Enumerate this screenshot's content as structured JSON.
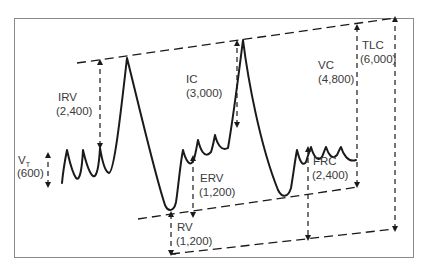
{
  "diagram": {
    "type": "lung-volumes-spirogram",
    "colors": {
      "stroke": "#1a1a1a",
      "frame": "#8a8a8a",
      "text": "#3a3a3a",
      "background": "#ffffff"
    },
    "labels": {
      "irv": {
        "name": "IRV",
        "value": "(2,400)"
      },
      "vt": {
        "name": "V",
        "subscript": "T",
        "value": "(600)"
      },
      "ic": {
        "name": "IC",
        "value": "(3,000)"
      },
      "erv": {
        "name": "ERV",
        "value": "(1,200)"
      },
      "rv": {
        "name": "RV",
        "value": "(1,200)"
      },
      "frc": {
        "name": "FRC",
        "value": "(2,400)"
      },
      "vc": {
        "name": "VC",
        "value": "(4,800)"
      },
      "tlc": {
        "name": "TLC",
        "value": "(6,000)"
      }
    }
  }
}
